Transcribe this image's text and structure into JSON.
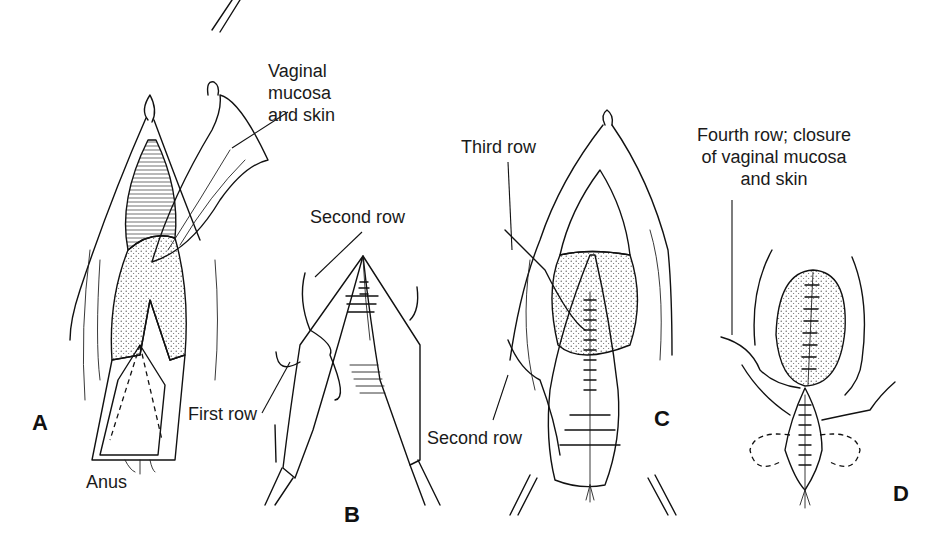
{
  "figure": {
    "panels": [
      {
        "id": "A",
        "letter": "A",
        "labels": {
          "vaginal_mucosa": "Vaginal\nmucosa\nand skin",
          "anus": "Anus"
        }
      },
      {
        "id": "B",
        "letter": "B",
        "labels": {
          "second_row": "Second row",
          "first_row": "First row"
        }
      },
      {
        "id": "C",
        "letter": "C",
        "labels": {
          "third_row": "Third row",
          "second_row": "Second row"
        }
      },
      {
        "id": "D",
        "letter": "D",
        "labels": {
          "fourth_row": "Fourth row; closure\nof vaginal mucosa\nand skin"
        }
      }
    ]
  }
}
